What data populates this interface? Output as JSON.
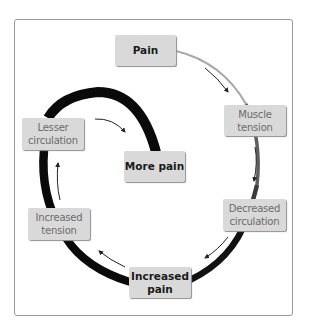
{
  "diagram": {
    "type": "cycle",
    "colors": {
      "frame_border": "#9a9a9a",
      "node_fill": "#d9d9d9",
      "node_shadow": "#8f8f8f",
      "bold_text": "#1a1a1a",
      "light_text": "#6b6b6b",
      "outer_arc_start": "#b0b0b0",
      "outer_arc_end": "#111111",
      "inner_spiral": "#0a0a0a",
      "arrow": "#222222"
    },
    "nodes": [
      {
        "id": "pain",
        "lines": [
          "Pain"
        ],
        "style": "bold"
      },
      {
        "id": "muscle-tension",
        "lines": [
          "Muscle",
          "tension"
        ],
        "style": "light"
      },
      {
        "id": "decreased-circulation",
        "lines": [
          "Decreased",
          "circulation"
        ],
        "style": "light"
      },
      {
        "id": "increased-pain",
        "lines": [
          "Increased",
          "pain"
        ],
        "style": "bold"
      },
      {
        "id": "increased-tension",
        "lines": [
          "Increased",
          "tension"
        ],
        "style": "light"
      },
      {
        "id": "lesser-circulation",
        "lines": [
          "Lesser",
          "circulation"
        ],
        "style": "light"
      },
      {
        "id": "more-pain",
        "lines": [
          "More pain"
        ],
        "style": "bold"
      }
    ],
    "edges": [
      {
        "from": "pain",
        "to": "muscle-tension"
      },
      {
        "from": "muscle-tension",
        "to": "decreased-circulation"
      },
      {
        "from": "decreased-circulation",
        "to": "increased-pain"
      },
      {
        "from": "increased-pain",
        "to": "increased-tension"
      },
      {
        "from": "increased-tension",
        "to": "lesser-circulation"
      },
      {
        "from": "lesser-circulation",
        "to": "more-pain"
      }
    ]
  }
}
